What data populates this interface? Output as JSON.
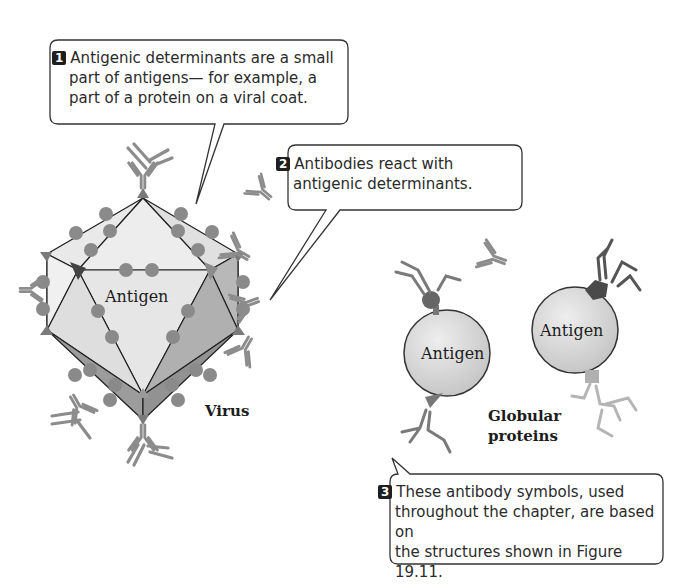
{
  "callouts": [
    {
      "number": "1",
      "lines": [
        "Antigenic determinants are a small",
        "part of antigens— for example, a",
        "part of a protein on a viral coat."
      ]
    },
    {
      "number": "2",
      "lines": [
        "Antibodies react with",
        "antigenic determinants."
      ]
    },
    {
      "number": "3",
      "lines": [
        "These antibody symbols, used",
        "throughout the chapter, are based on",
        "the structures shown in Figure 19.11."
      ]
    }
  ],
  "labels": {
    "virus_antigen": "Antigen",
    "virus": "Virus",
    "globular_antigen_1": "Antigen",
    "globular_antigen_2": "Antigen",
    "globular_line1": "Globular",
    "globular_line2": "proteins"
  },
  "colors": {
    "determinant": "#8a8a8a",
    "determinant_dark": "#555555",
    "antibody": "#8c8c8c",
    "antibody_dark": "#6a6a6a",
    "antibody_light": "#b5b5b5",
    "face_light": "#e8e8e8",
    "face_mid": "#c8c8c8",
    "face_dark": "#a8a8a8",
    "sphere": "#dcdcdc",
    "outline": "#222222"
  }
}
